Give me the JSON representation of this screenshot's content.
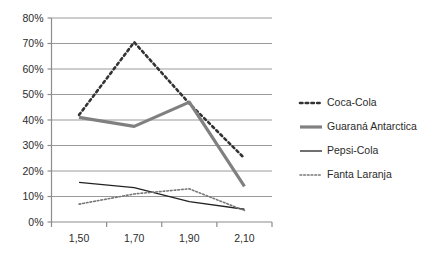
{
  "chart_data": {
    "type": "line",
    "title": "",
    "xlabel": "",
    "ylabel": "",
    "x": [
      "1,50",
      "1,70",
      "1,90",
      "2,10"
    ],
    "categories": [
      "1,50",
      "1,70",
      "1,90",
      "2,10"
    ],
    "xtick_labels": [
      "1,50",
      "1,70",
      "1,90",
      "2,10"
    ],
    "ytick_labels": [
      "0%",
      "10%",
      "20%",
      "30%",
      "40%",
      "50%",
      "60%",
      "70%",
      "80%"
    ],
    "ytick_values": [
      0,
      10,
      20,
      30,
      40,
      50,
      60,
      70,
      80
    ],
    "ylim": [
      0,
      80
    ],
    "grid": "horizontal",
    "legend_position": "right",
    "series": [
      {
        "name": "Coca-Cola",
        "values": [
          42,
          70.5,
          46.5,
          25
        ],
        "color": "#333333",
        "style": "dotted",
        "width": 2.6
      },
      {
        "name": "Guaraná Antarctica",
        "values": [
          41,
          37.5,
          47,
          14
        ],
        "color": "#808080",
        "style": "solid",
        "width": 3.2
      },
      {
        "name": "Pepsi-Cola",
        "values": [
          15.5,
          13.5,
          8,
          5
        ],
        "color": "#222222",
        "style": "solid",
        "width": 1.3
      },
      {
        "name": "Fanta Laranja",
        "values": [
          7,
          11,
          13,
          4.5
        ],
        "color": "#777777",
        "style": "dotted",
        "width": 1.6
      }
    ]
  },
  "legend": {
    "items": [
      {
        "label": "Coca-Cola"
      },
      {
        "label": "Guaraná Antarctica"
      },
      {
        "label": "Pepsi-Cola"
      },
      {
        "label": "Fanta Laranja"
      }
    ]
  },
  "axes": {
    "y_ticks": [
      {
        "label": "80%"
      },
      {
        "label": "70%"
      },
      {
        "label": "60%"
      },
      {
        "label": "50%"
      },
      {
        "label": "40%"
      },
      {
        "label": "30%"
      },
      {
        "label": "20%"
      },
      {
        "label": "10%"
      },
      {
        "label": "0%"
      }
    ],
    "x_ticks": [
      {
        "label": "1,50"
      },
      {
        "label": "1,70"
      },
      {
        "label": "1,90"
      },
      {
        "label": "2,10"
      }
    ]
  },
  "colors": {
    "grid": "#9a9a9a",
    "axis": "#8c8c8c",
    "text": "#2b2b2b",
    "background": "#ffffff"
  }
}
